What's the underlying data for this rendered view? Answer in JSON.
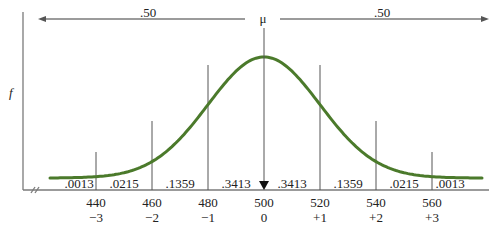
{
  "chart_data": {
    "type": "line",
    "title": "",
    "subtitle": "",
    "xlabel": "",
    "ylabel": "f",
    "mean_label": "μ",
    "mean": 500,
    "sd": 20,
    "curve": "normal",
    "half_area_labels": [
      ".50",
      ".50"
    ],
    "x": [
      440,
      460,
      480,
      500,
      520,
      540,
      560
    ],
    "z": [
      "−3",
      "−2",
      "−1",
      "0",
      "+1",
      "+2",
      "+3"
    ],
    "region_areas": [
      {
        "from": null,
        "to": 440,
        "value": ".0013"
      },
      {
        "from": 440,
        "to": 460,
        "value": ".0215"
      },
      {
        "from": 460,
        "to": 480,
        "value": ".1359"
      },
      {
        "from": 480,
        "to": 500,
        "value": ".3413"
      },
      {
        "from": 500,
        "to": 520,
        "value": ".3413"
      },
      {
        "from": 520,
        "to": 540,
        "value": ".1359"
      },
      {
        "from": 540,
        "to": 560,
        "value": ".0215"
      },
      {
        "from": 560,
        "to": null,
        "value": ".0013"
      }
    ],
    "grid": false,
    "legend": null,
    "colors": {
      "curve": "#4b7a2b",
      "axis": "#7a7a7a",
      "lines": "#555555",
      "text": "#222222"
    }
  },
  "labels": {
    "y_axis": "f",
    "mu": "μ",
    "left_half": ".50",
    "right_half": ".50"
  }
}
